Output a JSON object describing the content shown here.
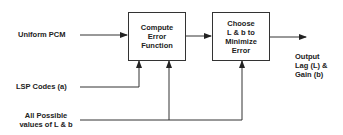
{
  "diagram": {
    "inputs": {
      "uniform_pcm": "Uniform PCM",
      "lsp_codes": "LSP Codes (a)",
      "all_possible": "All Possible\nvalues of L & b"
    },
    "blocks": [
      {
        "id": "compute",
        "label": "Compute\nError\nFunction"
      },
      {
        "id": "choose",
        "label": "Choose\nL & b to\nMinimize\nError"
      }
    ],
    "output": {
      "label": "Output\nLag (L) &\nGain (b)"
    },
    "edges": [
      {
        "from": "Uniform PCM",
        "to": "Compute Error Function"
      },
      {
        "from": "LSP Codes (a)",
        "to": "Compute Error Function"
      },
      {
        "from": "All Possible values of L & b",
        "to": "Compute Error Function"
      },
      {
        "from": "All Possible values of L & b",
        "to": "Choose L & b to Minimize Error"
      },
      {
        "from": "Compute Error Function",
        "to": "Choose L & b to Minimize Error"
      },
      {
        "from": "Choose L & b to Minimize Error",
        "to": "Output Lag (L) & Gain (b)"
      }
    ],
    "colors": {
      "line": "#333333",
      "text": "#222222",
      "background": "#ffffff"
    }
  }
}
